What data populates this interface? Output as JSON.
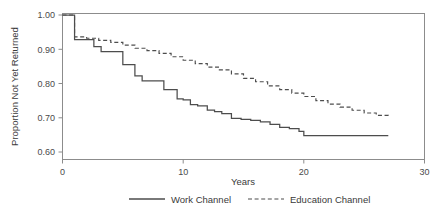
{
  "chart_data": {
    "type": "line",
    "title": "",
    "subtitle": "",
    "xlabel": "Years",
    "ylabel": "Proportion Not Yet Returned",
    "xlim": [
      0,
      30
    ],
    "ylim": [
      0.6,
      1.0
    ],
    "xticks": [
      0,
      10,
      20,
      30
    ],
    "xticklabels": [
      "0",
      "10",
      "20",
      "30"
    ],
    "yticks": [
      0.6,
      0.7,
      0.8,
      0.9,
      1.0
    ],
    "yticklabels": [
      "0.60",
      "0.70",
      "0.80",
      "0.90",
      "1.00"
    ],
    "grid": false,
    "legend_position": "below",
    "style": "step",
    "series": [
      {
        "name": "Work Channel",
        "linestyle": "solid",
        "color": "#4d4d4d",
        "x": [
          0,
          1,
          1,
          2,
          2.6,
          3.2,
          4,
          5,
          5.5,
          6,
          6.6,
          7.2,
          8,
          8.4,
          9,
          9.5,
          10,
          10.6,
          11.2,
          12,
          12.6,
          13.2,
          14,
          14.8,
          15.6,
          16.4,
          17.2,
          18,
          18.8,
          19.6,
          20,
          27
        ],
        "y": [
          1.0,
          1.0,
          0.928,
          0.928,
          0.908,
          0.893,
          0.893,
          0.855,
          0.855,
          0.822,
          0.808,
          0.808,
          0.808,
          0.782,
          0.782,
          0.755,
          0.752,
          0.738,
          0.735,
          0.722,
          0.718,
          0.712,
          0.698,
          0.695,
          0.692,
          0.688,
          0.681,
          0.672,
          0.668,
          0.66,
          0.648,
          0.648
        ]
      },
      {
        "name": "Education Channel",
        "linestyle": "dashed",
        "color": "#4d4d4d",
        "x": [
          0,
          1,
          1,
          2,
          3,
          4,
          5,
          6,
          7,
          8,
          9,
          10,
          11,
          12,
          13,
          14,
          15,
          16,
          17,
          18,
          19,
          20,
          21,
          22,
          23,
          24,
          25,
          26,
          27
        ],
        "y": [
          1.0,
          1.0,
          0.936,
          0.932,
          0.926,
          0.92,
          0.912,
          0.903,
          0.896,
          0.888,
          0.878,
          0.868,
          0.858,
          0.848,
          0.84,
          0.828,
          0.815,
          0.805,
          0.793,
          0.782,
          0.772,
          0.762,
          0.75,
          0.74,
          0.731,
          0.722,
          0.714,
          0.707,
          0.701
        ]
      }
    ],
    "legend": [
      {
        "label": "Work Channel",
        "linestyle": "solid"
      },
      {
        "label": "Education Channel",
        "linestyle": "dashed"
      }
    ],
    "colors": {
      "axis": "#8c8c8c",
      "text": "#3a3a3a",
      "series": "#4d4d4d",
      "background": "#ffffff"
    }
  }
}
